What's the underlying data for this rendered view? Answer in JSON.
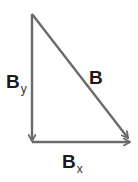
{
  "diagram": {
    "type": "vector-decomposition-right-triangle",
    "line_color": "#6b6b6b",
    "vectors": [
      {
        "name": "By",
        "label": "B",
        "subscript": "y",
        "from": [
          32,
          14
        ],
        "to": [
          32,
          141
        ]
      },
      {
        "name": "Bx",
        "label": "B",
        "subscript": "x",
        "from": [
          32,
          142
        ],
        "to": [
          131,
          142
        ]
      },
      {
        "name": "B",
        "label": "B",
        "subscript": "",
        "from": [
          32,
          14
        ],
        "to": [
          129,
          139
        ]
      }
    ]
  }
}
